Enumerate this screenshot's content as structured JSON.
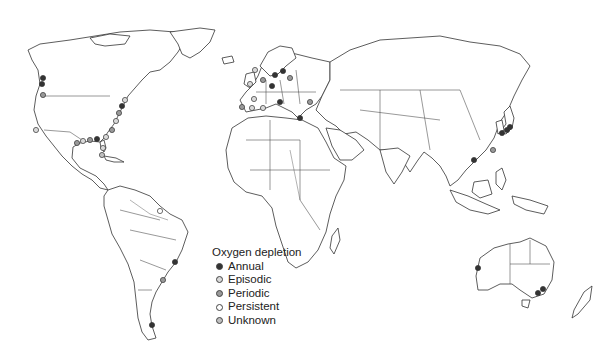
{
  "legend": {
    "title": "Oxygen depletion",
    "items": [
      {
        "label": "Annual",
        "fill": "#333333"
      },
      {
        "label": "Episodic",
        "fill": "#d9d9d9"
      },
      {
        "label": "Periodic",
        "fill": "#999999"
      },
      {
        "label": "Persistent",
        "fill": "#ffffff"
      },
      {
        "label": "Unknown",
        "fill": "#bfbfbf"
      }
    ]
  },
  "markers": [
    {
      "region": "us-west-coast",
      "x": 43,
      "y": 78,
      "type": "annual"
    },
    {
      "region": "us-west-coast",
      "x": 42,
      "y": 84,
      "type": "annual"
    },
    {
      "region": "us-west-coast",
      "x": 43,
      "y": 95,
      "type": "periodic"
    },
    {
      "region": "california",
      "x": 36,
      "y": 130,
      "type": "episodic"
    },
    {
      "region": "us-east-coast",
      "x": 125,
      "y": 100,
      "type": "episodic"
    },
    {
      "region": "us-east-coast",
      "x": 122,
      "y": 106,
      "type": "annual"
    },
    {
      "region": "us-east-coast",
      "x": 119,
      "y": 113,
      "type": "periodic"
    },
    {
      "region": "us-east-coast",
      "x": 116,
      "y": 121,
      "type": "episodic"
    },
    {
      "region": "us-east-coast",
      "x": 112,
      "y": 130,
      "type": "periodic"
    },
    {
      "region": "gulf-of-mexico",
      "x": 106,
      "y": 137,
      "type": "episodic"
    },
    {
      "region": "gulf-of-mexico",
      "x": 97,
      "y": 139,
      "type": "annual"
    },
    {
      "region": "gulf-of-mexico",
      "x": 90,
      "y": 140,
      "type": "periodic"
    },
    {
      "region": "gulf-of-mexico",
      "x": 83,
      "y": 141,
      "type": "episodic"
    },
    {
      "region": "gulf-of-mexico",
      "x": 77,
      "y": 143,
      "type": "periodic"
    },
    {
      "region": "florida",
      "x": 103,
      "y": 148,
      "type": "episodic"
    },
    {
      "region": "caribbean",
      "x": 102,
      "y": 155,
      "type": "unknown"
    },
    {
      "region": "brazil-north",
      "x": 160,
      "y": 211,
      "type": "persistent"
    },
    {
      "region": "brazil-south",
      "x": 175,
      "y": 262,
      "type": "annual"
    },
    {
      "region": "uruguay",
      "x": 163,
      "y": 280,
      "type": "periodic"
    },
    {
      "region": "chile",
      "x": 152,
      "y": 325,
      "type": "annual"
    },
    {
      "region": "norway",
      "x": 255,
      "y": 70,
      "type": "episodic"
    },
    {
      "region": "uk",
      "x": 250,
      "y": 84,
      "type": "episodic"
    },
    {
      "region": "north-sea",
      "x": 263,
      "y": 80,
      "type": "periodic"
    },
    {
      "region": "baltic",
      "x": 275,
      "y": 75,
      "type": "annual"
    },
    {
      "region": "baltic",
      "x": 283,
      "y": 71,
      "type": "annual"
    },
    {
      "region": "baltic",
      "x": 290,
      "y": 78,
      "type": "periodic"
    },
    {
      "region": "germany",
      "x": 272,
      "y": 86,
      "type": "annual"
    },
    {
      "region": "france",
      "x": 254,
      "y": 99,
      "type": "episodic"
    },
    {
      "region": "iberia",
      "x": 242,
      "y": 107,
      "type": "periodic"
    },
    {
      "region": "iberia",
      "x": 252,
      "y": 108,
      "type": "episodic"
    },
    {
      "region": "mediterranean",
      "x": 263,
      "y": 108,
      "type": "episodic"
    },
    {
      "region": "adriatic",
      "x": 280,
      "y": 102,
      "type": "annual"
    },
    {
      "region": "greece",
      "x": 300,
      "y": 118,
      "type": "annual"
    },
    {
      "region": "black-sea",
      "x": 310,
      "y": 102,
      "type": "periodic"
    },
    {
      "region": "japan",
      "x": 510,
      "y": 127,
      "type": "annual"
    },
    {
      "region": "japan",
      "x": 507,
      "y": 130,
      "type": "annual"
    },
    {
      "region": "korea",
      "x": 502,
      "y": 133,
      "type": "annual"
    },
    {
      "region": "east-china-sea",
      "x": 493,
      "y": 150,
      "type": "periodic"
    },
    {
      "region": "hong-kong",
      "x": 474,
      "y": 160,
      "type": "annual"
    },
    {
      "region": "australia-se",
      "x": 538,
      "y": 293,
      "type": "annual"
    },
    {
      "region": "australia-se",
      "x": 543,
      "y": 289,
      "type": "annual"
    },
    {
      "region": "australia-w",
      "x": 478,
      "y": 268,
      "type": "annual"
    }
  ]
}
